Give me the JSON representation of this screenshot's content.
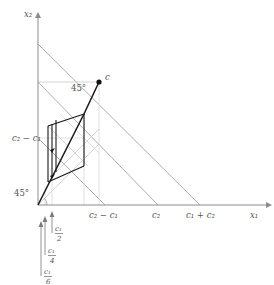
{
  "figure": {
    "type": "geometry-diagram",
    "axes": {
      "x_label": "x₁",
      "y_label": "x₂",
      "origin_label": ""
    },
    "x_ticks": [
      {
        "label_main": "c₂ − c₁",
        "px": 105
      },
      {
        "label_main": "c₂",
        "px": 158
      },
      {
        "label_main": "c₁ + c₂",
        "px": 200
      }
    ],
    "y_ticks": [
      {
        "label_main": "c₂ − c₁",
        "px": 138
      }
    ],
    "angles": [
      {
        "label": "45°",
        "at": "origin"
      },
      {
        "label": "45°",
        "at": "point-c"
      }
    ],
    "points": [
      {
        "label": "c",
        "x_px": 99,
        "y_px": 82
      }
    ],
    "measure_arrows": [
      {
        "label_num": "c₁",
        "label_den": "2",
        "tip_px": 52
      },
      {
        "label_num": "c₁",
        "label_den": "4",
        "tip_px": 45
      },
      {
        "label_num": "c₁",
        "label_den": "6",
        "tip_px": 41
      }
    ],
    "colors": {
      "axis": "#8c8c8c",
      "gray_line": "#9a9a9a",
      "faint_line": "#c9c9c9",
      "bold_line": "#1a1a1a",
      "point": "#111111",
      "text": "#555555",
      "background": "#ffffff"
    }
  }
}
